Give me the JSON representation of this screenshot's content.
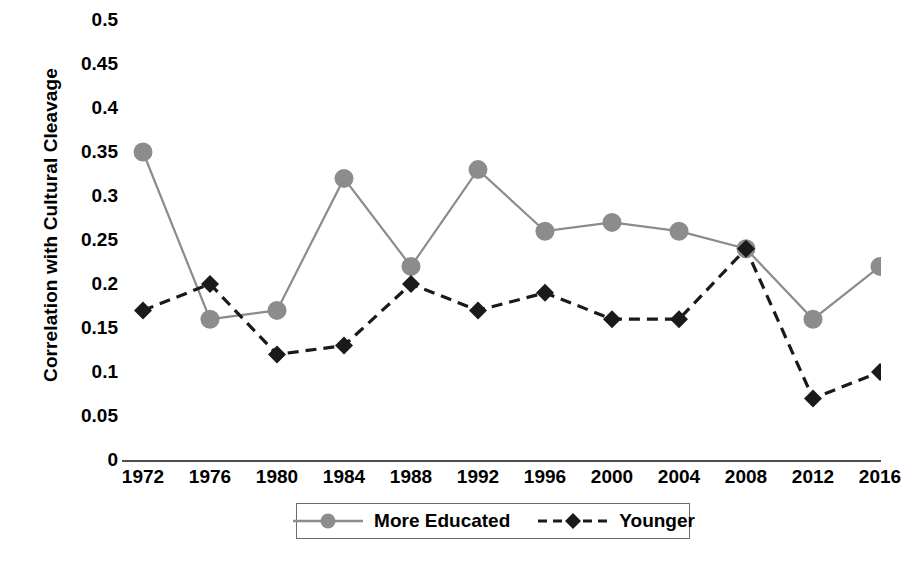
{
  "chart_data": {
    "type": "line",
    "title": "",
    "xlabel": "",
    "ylabel": "Correlation with Cultural Cleavage",
    "x": [
      1972,
      1976,
      1980,
      1984,
      1988,
      1992,
      1996,
      2000,
      2004,
      2008,
      2012,
      2016
    ],
    "categories": [
      "1972",
      "1976",
      "1980",
      "1984",
      "1988",
      "1992",
      "1996",
      "2000",
      "2004",
      "2008",
      "2012",
      "2016"
    ],
    "ylim": [
      0,
      0.5
    ],
    "yticks": [
      0,
      0.05,
      0.1,
      0.15,
      0.2,
      0.25,
      0.3,
      0.35,
      0.4,
      0.45,
      0.5
    ],
    "ytick_labels": [
      "0",
      "0.05",
      "0.1",
      "0.15",
      "0.2",
      "0.25",
      "0.3",
      "0.35",
      "0.4",
      "0.45",
      "0.5"
    ],
    "grid": false,
    "legend_position": "bottom",
    "series": [
      {
        "name": "More Educated",
        "color": "#8c8c8c",
        "marker": "circle",
        "linestyle": "solid",
        "values": [
          0.35,
          0.16,
          0.17,
          0.32,
          0.22,
          0.33,
          0.26,
          0.27,
          0.26,
          0.24,
          0.16,
          0.22
        ]
      },
      {
        "name": "Younger",
        "color": "#1a1a1a",
        "marker": "diamond",
        "linestyle": "dashed",
        "values": [
          0.17,
          0.2,
          0.12,
          0.13,
          0.2,
          0.17,
          0.19,
          0.16,
          0.16,
          0.24,
          0.07,
          0.1
        ]
      }
    ]
  },
  "legend": {
    "entries": [
      {
        "label": "More Educated"
      },
      {
        "label": "Younger"
      }
    ]
  },
  "axis": {
    "y_title": "Correlation with Cultural Cleavage"
  }
}
